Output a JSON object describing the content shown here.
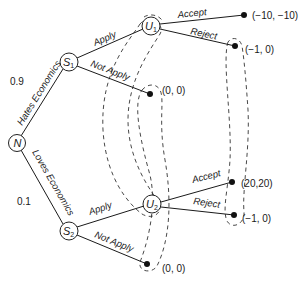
{
  "diagram": {
    "type": "game-tree",
    "nodes": {
      "nature": {
        "letter": "N",
        "sub": ""
      },
      "s1": {
        "letter": "S",
        "sub": "1"
      },
      "s2": {
        "letter": "S",
        "sub": "2"
      },
      "u1": {
        "letter": "U",
        "sub": "1"
      },
      "u2": {
        "letter": "U",
        "sub": "2"
      }
    },
    "edges": {
      "hates": "Hates Economics",
      "loves": "Loves Economics",
      "s1_apply": "Apply",
      "s1_not_apply": "Not Apply",
      "s2_apply": "Apply",
      "s2_not_apply": "Not Apply",
      "u1_accept": "Accept",
      "u1_reject": "Reject",
      "u2_accept": "Accept",
      "u2_reject": "Reject"
    },
    "probabilities": {
      "hates": "0.9",
      "loves": "0.1"
    },
    "payoffs": {
      "u1_accept": "(−10, −10)",
      "u1_reject": "(−1, 0)",
      "s1_not_apply": "(0, 0)",
      "u2_accept": "(20,20)",
      "u2_reject": "(−1, 0)",
      "s2_not_apply": "(0, 0)"
    },
    "information_sets": [
      "U1–U2",
      "Not Apply outcomes (0, 0)",
      "Reject outcomes (−1, 0)"
    ]
  }
}
